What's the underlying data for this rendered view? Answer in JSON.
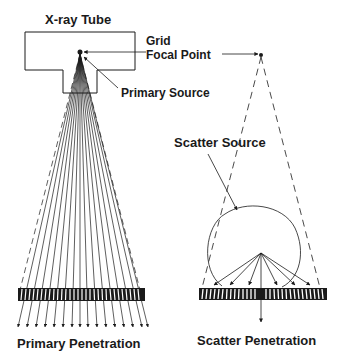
{
  "diagram": {
    "labels": {
      "tube": "X-ray Tube",
      "grid_line1": "Grid",
      "grid_line2": "Focal Point",
      "primary_source": "Primary Source",
      "scatter_source": "Scatter Source",
      "primary_penetration": "Primary Penetration",
      "scatter_penetration": "Scatter Penetration"
    },
    "panels": [
      {
        "name": "primary",
        "description": "Fan of primary rays from focal point through grid, all pass"
      },
      {
        "name": "scatter",
        "description": "Scatter rays from a point inside the object hit grid at angles; only the perpendicular ray passes"
      }
    ],
    "colors": {
      "ink": "#1a1a1a",
      "background": "#ffffff"
    }
  }
}
